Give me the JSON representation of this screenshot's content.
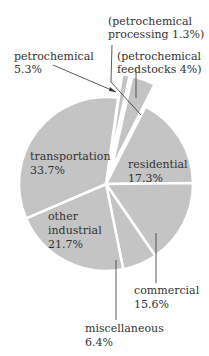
{
  "chart_data": {
    "type": "pie",
    "title": "",
    "categories": [
      "petrochemical processing",
      "petrochemical feedstocks",
      "residential",
      "commercial",
      "miscellaneous",
      "other industrial",
      "transportation"
    ],
    "values": [
      1.3,
      4.0,
      17.3,
      15.6,
      6.4,
      21.7,
      33.7
    ],
    "group_annotation": {
      "label": "petrochemical",
      "value": 5.3,
      "members": [
        "petrochemical processing",
        "petrochemical feedstocks"
      ],
      "exploded": true
    },
    "colors": {
      "slice": "#c4c4c4",
      "separator": "#ffffff",
      "text": "#333333"
    },
    "legend": "none (direct labels)"
  },
  "labels": {
    "proc_line1": "(petrochemical",
    "proc_line2": "processing 1.3%)",
    "feed_line1": "(petrochemical",
    "feed_line2": "feedstocks 4%)",
    "petro_line1": "petrochemical",
    "petro_line2": "5.3%",
    "transport_line1": "transportation",
    "transport_line2": "33.7%",
    "residential_line1": "residential",
    "residential_line2": "17.3%",
    "other_line1": "other",
    "other_line2": "industrial",
    "other_line3": "21.7%",
    "commercial_line1": "commercial",
    "commercial_line2": "15.6%",
    "misc_line1": "miscellaneous",
    "misc_line2": "6.4%"
  }
}
